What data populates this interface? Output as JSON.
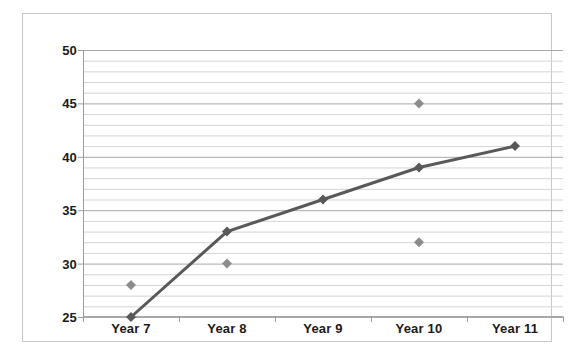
{
  "chart_data": {
    "type": "line",
    "title": "",
    "subtitle": "",
    "xlabel": "",
    "ylabel": "",
    "categories": [
      "Year 7",
      "Year 8",
      "Year 9",
      "Year 10",
      "Year 11"
    ],
    "ylim": [
      25,
      50
    ],
    "y_ticks": [
      25,
      30,
      35,
      40,
      45,
      50
    ],
    "y_tick_labels": [
      "25",
      "30",
      "35",
      "40",
      "45",
      "50"
    ],
    "y_minor_step": 1,
    "grid": true,
    "grid_axis": "y",
    "legend": "none",
    "series": [
      {
        "name": "line-series",
        "type": "line",
        "color": "#595959",
        "marker": "diamond",
        "values": [
          25,
          33,
          36,
          39,
          41
        ]
      },
      {
        "name": "scatter-series",
        "type": "scatter",
        "color": "#8c8c8c",
        "marker": "diamond",
        "points": [
          {
            "category": "Year 7",
            "value": 28
          },
          {
            "category": "Year 8",
            "value": 30
          },
          {
            "category": "Year 10",
            "value": 45
          },
          {
            "category": "Year 10",
            "value": 32
          }
        ]
      }
    ],
    "colors": {
      "line": "#595959",
      "scatter": "#8c8c8c",
      "grid_major": "#a8a8a8",
      "grid_minor": "#d4d4d4",
      "axis": "#9a9a9a",
      "frame": "#c8c8c8",
      "text": "#1a1a1a",
      "background": "#ffffff"
    }
  }
}
